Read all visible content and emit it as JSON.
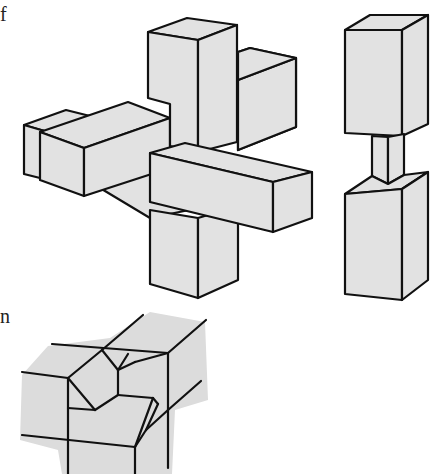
{
  "page": {
    "edge_text_fragments": [
      "f",
      "n"
    ]
  },
  "figure": {
    "views": [
      {
        "id": "assembled",
        "description": "assembled cross of three square bars"
      },
      {
        "id": "piece",
        "description": "single vertical piece with necked-down centre"
      },
      {
        "id": "corner-detail",
        "description": "corner joint detail with mitred notches"
      }
    ],
    "colors": {
      "face_fill": "#e2e2e2",
      "stroke": "#111111",
      "background": "#ffffff"
    }
  }
}
